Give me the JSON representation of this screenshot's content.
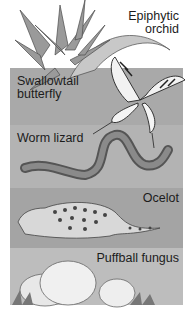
{
  "figure": {
    "layers": [
      {
        "label_lines": [
          "Epiphytic",
          "orchid"
        ],
        "background": "#ffffff"
      },
      {
        "label_lines": [
          "Swallowtail",
          "butterfly"
        ],
        "background": "#a9a9a9"
      },
      {
        "label_lines": [
          "Worm lizard"
        ],
        "background": "#b3b3b3"
      },
      {
        "label_lines": [
          "Ocelot"
        ],
        "background": "#a4a4a4"
      },
      {
        "label_lines": [
          "Puffball fungus"
        ],
        "background": "#bdbdbd"
      }
    ]
  }
}
